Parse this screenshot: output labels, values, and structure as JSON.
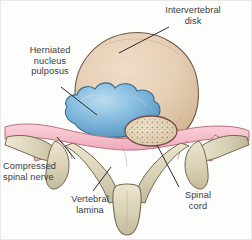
{
  "figure": {
    "background_color": "#fdfdfc"
  },
  "labels": {
    "intervertebral_disk": "Intervertebral\ndisk",
    "herniated_nucleus_pulposus": "Herniated\nnucleus\npulposus",
    "compressed_spinal_nerve": "Compressed\nspinal nerve",
    "vertebral_lamina": "Vertebral\nlamina",
    "spinal_cord": "Spinal\ncord"
  },
  "anatomy": {
    "parts": [
      {
        "name": "intervertebral-disk",
        "fill": "#e3cdb4",
        "stroke": "#6d5a46"
      },
      {
        "name": "herniated-nucleus-pulposus",
        "fill": "#7fb9dd",
        "stroke": "#3d6d8f"
      },
      {
        "name": "spinal-nerve",
        "fill": "#f4b9c6",
        "stroke": "#b8707f"
      },
      {
        "name": "spinal-cord",
        "fill": "#e4d6bd",
        "stroke": "#7a4a44"
      },
      {
        "name": "vertebral-bone",
        "fill": "#d9d2b8",
        "stroke": "#6f6950"
      }
    ]
  },
  "colors": {
    "text": "#3b3b3b",
    "leader_line": "#2a2a2a",
    "disk_fill": "#e3cdb4",
    "nucleus_fill": "#7fb9dd",
    "nerve_fill": "#f4b9c6",
    "bone_fill": "#d9d2b8",
    "cord_fill": "#e4d6bd"
  }
}
